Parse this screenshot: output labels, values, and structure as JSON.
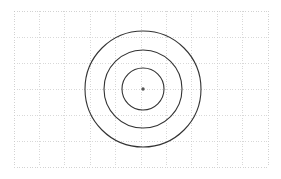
{
  "canvas": {
    "width": 281,
    "height": 179,
    "background_color": "#ffffff"
  },
  "grid": {
    "name": "dotted-grid",
    "x": 14,
    "y": 11,
    "width": 254,
    "height": 156,
    "columns": 10,
    "rows": 6,
    "cell_width": 25.4,
    "cell_height": 26,
    "line_color": "#c8c8c8",
    "line_width": 0.7,
    "dash_pattern": "1,1.6",
    "border_color": "#bfbfbf"
  },
  "chart_data": {
    "type": "scatter",
    "title": "",
    "subtitle": "",
    "xlabel": "",
    "ylabel": "",
    "grid": true,
    "legend_position": "none",
    "center": {
      "x": 143,
      "y": 89
    },
    "circles": [
      {
        "label": "outer-circle",
        "radius": 58,
        "stroke": "#333333",
        "stroke_width": 1.1
      },
      {
        "label": "middle-circle",
        "radius": 39,
        "stroke": "#333333",
        "stroke_width": 1.1
      },
      {
        "label": "inner-circle",
        "radius": 21,
        "stroke": "#333333",
        "stroke_width": 1.1
      }
    ],
    "center_point": {
      "label": "center-dot",
      "radius": 1.7,
      "fill": "#555555"
    },
    "x": [
      143
    ],
    "values": [
      58,
      39,
      21
    ],
    "categories": [
      "outer-circle",
      "middle-circle",
      "inner-circle"
    ],
    "xlim": [
      14,
      268
    ],
    "ylim": [
      11,
      167
    ]
  }
}
